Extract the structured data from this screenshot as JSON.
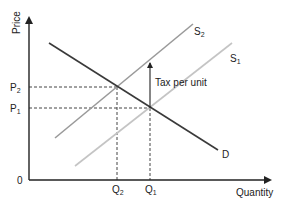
{
  "diagram": {
    "type": "supply-demand-tax",
    "axes": {
      "y_label": "Price",
      "x_label": "Quantity",
      "origin_label": "0"
    },
    "price_levels": [
      {
        "name": "P",
        "sub": "2"
      },
      {
        "name": "P",
        "sub": "1"
      }
    ],
    "quantity_levels": [
      {
        "name": "Q",
        "sub": "2"
      },
      {
        "name": "Q",
        "sub": "1"
      }
    ],
    "curves": {
      "demand": {
        "label": "D",
        "color": "#3a3a3a"
      },
      "supply_new": {
        "label": "S",
        "sub": "2",
        "color": "#9a9a9a"
      },
      "supply_orig": {
        "label": "S",
        "sub": "1",
        "color": "#c4c4c4"
      }
    },
    "annotation": "Tax per unit"
  }
}
